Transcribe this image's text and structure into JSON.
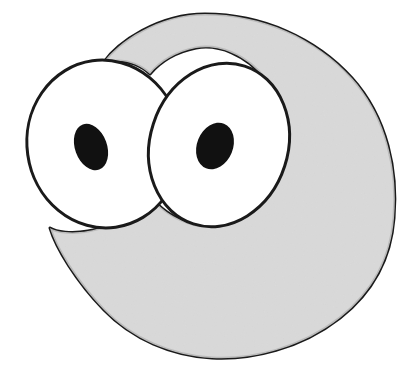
{
  "canvas": {
    "width": 409,
    "height": 377,
    "background_color": "#ffffff",
    "description": "line-art cartoon creature face with two large googly eyes on a rounded gray blob body"
  },
  "palette": {
    "background": "#ffffff",
    "body_fill": "#d9d9d9",
    "eye_white_fill": "#ffffff",
    "pupil_fill": "#111111",
    "outline_stroke": "#1a1a1a"
  },
  "figure": {
    "name": "cartoon-creature",
    "stroke_width": 3,
    "body": {
      "name": "body-blob",
      "fill": "#d9d9d9",
      "stroke": "#1a1a1a",
      "stroke_width": 3,
      "path": "M 205 14 C 262 14 316 38 352 78 C 388 118 398 172 394 218 C 391 258 373 292 340 318 C 300 349 252 360 212 358 C 172 356 132 339 104 310 C 76 281 56 248 50 228 C 56 232 72 234 88 231 C 112 227 134 214 149 194 C 157 206 174 220 196 225 C 224 231 252 219 268 196 C 282 176 288 152 286 132 C 284 110 276 92 266 80 C 246 54 218 44 196 48 C 176 52 160 62 150 74 C 142 66 128 60 116 61 C 108 62 103 63 103 63 C 118 42 158 14 205 14 Z",
      "bounds": {
        "x": 48,
        "y": 13,
        "width": 347,
        "height": 346
      }
    },
    "eyes": [
      {
        "name": "left-eye",
        "white": {
          "name": "left-eye-white",
          "fill": "#ffffff",
          "stroke": "#1a1a1a",
          "cx": 104,
          "cy": 144,
          "rx": 77,
          "ry": 84,
          "rotation": -8
        },
        "pupil": {
          "name": "left-eye-pupil",
          "fill": "#111111",
          "cx": 91,
          "cy": 147,
          "rx": 16,
          "ry": 24,
          "rotation": -20
        }
      },
      {
        "name": "right-eye",
        "white": {
          "name": "right-eye-white",
          "fill": "#ffffff",
          "stroke": "#1a1a1a",
          "cx": 219,
          "cy": 145,
          "rx": 69,
          "ry": 83,
          "rotation": 18
        },
        "pupil": {
          "name": "right-eye-pupil",
          "fill": "#111111",
          "cx": 215,
          "cy": 146,
          "rx": 18,
          "ry": 24,
          "rotation": 22
        }
      }
    ]
  }
}
